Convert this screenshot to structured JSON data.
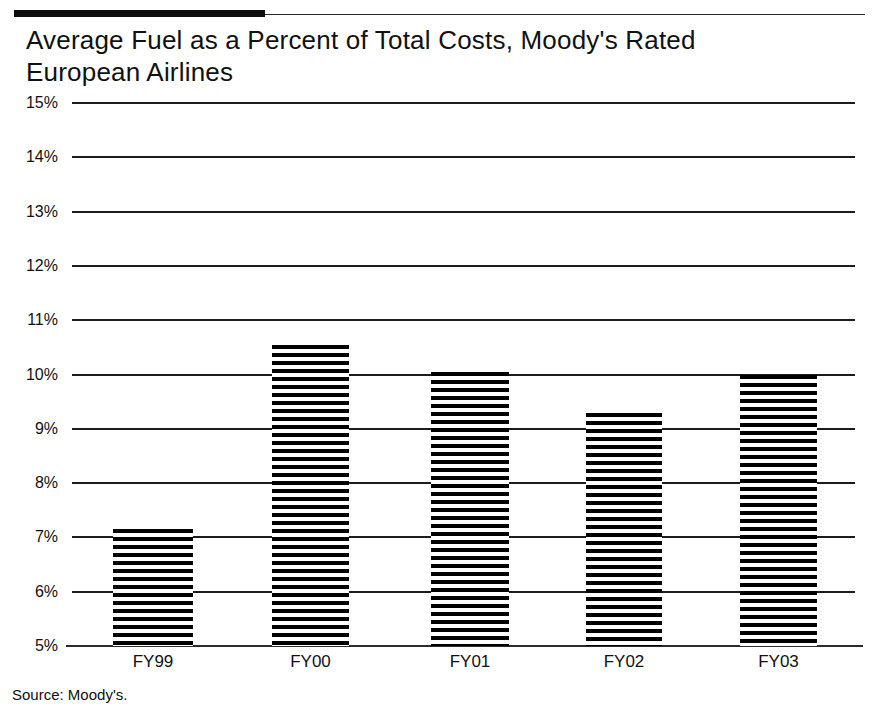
{
  "title": "Average Fuel as a Percent of Total Costs, Moody's Rated\nEuropean Airlines",
  "source_note": "Source: Moody's.",
  "chart_data": {
    "type": "bar",
    "title": "Average Fuel as a Percent of Total Costs, Moody's Rated European Airlines",
    "subtitle": "",
    "xlabel": "",
    "ylabel": "",
    "categories": [
      "FY99",
      "FY00",
      "FY01",
      "FY02",
      "FY03"
    ],
    "values": [
      7.15,
      10.55,
      10.05,
      9.3,
      10.0
    ],
    "series": [
      {
        "name": "Average Fuel as a Percent of Total Costs",
        "values": [
          7.15,
          10.55,
          10.05,
          9.3,
          10.0
        ]
      }
    ],
    "ylim": [
      5,
      15
    ],
    "ytick_labels": [
      "15%",
      "14%",
      "13%",
      "12%",
      "11%",
      "10%",
      "9%",
      "8%",
      "7%",
      "6%",
      "5%"
    ],
    "ytick_values": [
      15,
      14,
      13,
      12,
      11,
      10,
      9,
      8,
      7,
      6,
      5
    ],
    "grid": true,
    "legend": false,
    "legend_position": "none",
    "bar_fill": "horizontal-stripes",
    "colors": {
      "bar": "#000000",
      "gridline": "#1c1c1c",
      "text": "#111111",
      "background": "#ffffff"
    },
    "source": "Source: Moody's."
  }
}
